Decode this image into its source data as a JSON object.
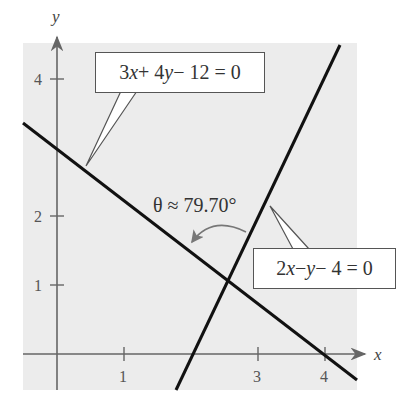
{
  "figure": {
    "type": "diagram",
    "axes": {
      "x_label": "x",
      "y_label": "y",
      "x_ticks": [
        "1",
        "3",
        "4"
      ],
      "y_ticks": [
        "1",
        "2",
        "4"
      ]
    },
    "lines": [
      {
        "name": "line-1",
        "equation": "3x + 4y − 12 = 0",
        "slope": -0.75,
        "y_intercept": 3
      },
      {
        "name": "line-2",
        "equation": "2x − y − 4 = 0",
        "slope": 2,
        "y_intercept": -4
      }
    ],
    "labels": {
      "eq1_parts": [
        "3",
        "x",
        " + 4",
        "y",
        " − 12 = 0"
      ],
      "eq2_parts": [
        "2",
        "x",
        " − ",
        "y",
        " − 4 = 0"
      ],
      "angle": "θ ≈ 79.70°"
    },
    "colors": {
      "panel": "#ececec",
      "lines": "#111111",
      "axes": "#666666",
      "arc": "#777777"
    }
  }
}
